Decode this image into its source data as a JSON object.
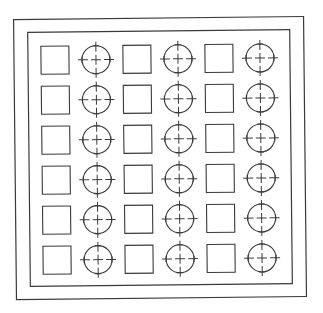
{
  "diagram": {
    "width": 323,
    "height": 313,
    "background": "#ffffff",
    "stroke": "#3a3a3a",
    "rotation_deg": -0.6,
    "outer_border": {
      "x": 15,
      "y": 18,
      "w": 290,
      "h": 280
    },
    "inner_border": {
      "x": 29,
      "y": 31,
      "w": 262,
      "h": 254
    },
    "grid": {
      "rows": 6,
      "columns": [
        "square",
        "circle",
        "square",
        "circle",
        "square",
        "circle"
      ],
      "origin_x": 42,
      "origin_y": 45,
      "row_pitch": 40,
      "pair_pitch": 82,
      "square_size": 28,
      "circle_offset_x": 55,
      "circle_radius": 14,
      "crosshair_extent": 18
    }
  }
}
